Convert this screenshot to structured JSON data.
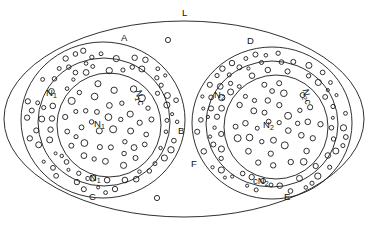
{
  "figure": {
    "type": "set-diagram",
    "background_color": "#ffffff",
    "stroke_color": "#1a1a1a"
  },
  "labels": {
    "universe": "L",
    "left": {
      "outer_top": "A",
      "outer_right": "B",
      "outer_bottom": "C",
      "core": "N1",
      "ring_left": "N1",
      "ring_right": "cN1",
      "ring_bottom": "cN1"
    },
    "right": {
      "outer_top": "D",
      "outer_bottom": "E",
      "outer_left": "F",
      "core": "N2",
      "ring_left": "N2",
      "ring_right": "N2c",
      "ring_bottom": "cN2"
    }
  },
  "label_text": {
    "L": "L",
    "A": "A",
    "B": "B",
    "C": "C",
    "D": "D",
    "E": "E",
    "F": "F",
    "N1": "N",
    "N2": "N",
    "sub1": "1",
    "sub2": "2",
    "cN1": "cN",
    "cN2": "cN",
    "N1c": "N",
    "N2c": "N",
    "c": "c"
  },
  "chart_data": {
    "type": "scatter",
    "title": "",
    "xlabel": "",
    "ylabel": "",
    "grid": false,
    "legend": null,
    "regions": [
      {
        "name": "L",
        "shape": "ellipse",
        "cx": 184,
        "cy": 119,
        "rx": 180,
        "ry": 98
      },
      {
        "name": "A-B-C outer circle (left)",
        "shape": "ellipse",
        "cx": 103,
        "cy": 120,
        "rx": 82,
        "ry": 78
      },
      {
        "name": "cN1 ring (left middle)",
        "shape": "ellipse",
        "cx": 104,
        "cy": 122,
        "rx": 66,
        "ry": 64
      },
      {
        "name": "N1 core (left inner)",
        "shape": "ellipse",
        "cx": 109,
        "cy": 125,
        "rx": 52,
        "ry": 52
      },
      {
        "name": "D-E-F outer circle (right)",
        "shape": "ellipse",
        "cx": 272,
        "cy": 123,
        "rx": 80,
        "ry": 76
      },
      {
        "name": "cN2 ring (right middle)",
        "shape": "ellipse",
        "cx": 272,
        "cy": 124,
        "rx": 66,
        "ry": 63
      },
      {
        "name": "N2 core (right inner)",
        "shape": "ellipse",
        "cx": 276,
        "cy": 127,
        "rx": 52,
        "ry": 52
      }
    ],
    "free_points": [
      {
        "x": 168,
        "y": 40,
        "r": 2.6,
        "region": "L"
      },
      {
        "x": 157,
        "y": 198,
        "r": 2.6,
        "region": "L"
      }
    ],
    "counts": {
      "left_core_points": 40,
      "left_ring_points": 72,
      "right_core_points": 38,
      "right_ring_points": 74,
      "free_points": 2
    }
  }
}
